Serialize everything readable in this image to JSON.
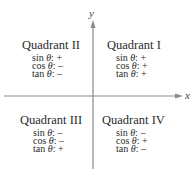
{
  "axes": {
    "x_label": "x",
    "y_label": "y",
    "color": "#888888"
  },
  "quadrants": [
    {
      "id": "I",
      "title": "Quadrant I",
      "rows": [
        {
          "fn": "sin",
          "var": "θ",
          "sign": "+"
        },
        {
          "fn": "cos",
          "var": "θ",
          "sign": "+"
        },
        {
          "fn": "tan",
          "var": "θ",
          "sign": "+"
        }
      ]
    },
    {
      "id": "II",
      "title": "Quadrant II",
      "rows": [
        {
          "fn": "sin",
          "var": "θ",
          "sign": "+"
        },
        {
          "fn": "cos",
          "var": "θ",
          "sign": "–"
        },
        {
          "fn": "tan",
          "var": "θ",
          "sign": "–"
        }
      ]
    },
    {
      "id": "III",
      "title": "Quadrant III",
      "rows": [
        {
          "fn": "sin",
          "var": "θ",
          "sign": "–"
        },
        {
          "fn": "cos",
          "var": "θ",
          "sign": "–"
        },
        {
          "fn": "tan",
          "var": "θ",
          "sign": "+"
        }
      ]
    },
    {
      "id": "IV",
      "title": "Quadrant IV",
      "rows": [
        {
          "fn": "sin",
          "var": "θ",
          "sign": "–"
        },
        {
          "fn": "cos",
          "var": "θ",
          "sign": "+"
        },
        {
          "fn": "tan",
          "var": "θ",
          "sign": "–"
        }
      ]
    }
  ]
}
